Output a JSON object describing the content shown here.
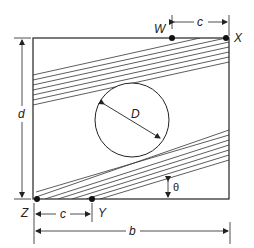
{
  "diagram": {
    "type": "rectangular plate with circular hole and two inclined stripe bands",
    "labels": {
      "W": "W",
      "X": "X",
      "Y": "Y",
      "Z": "Z",
      "c_top": "c",
      "c_bottom": "c",
      "d": "d",
      "b": "b",
      "D": "D",
      "theta": "θ"
    },
    "upper_band_lines": 7,
    "lower_band_lines": 7,
    "colors": {
      "stroke": "#222222",
      "background": "#ffffff"
    }
  }
}
